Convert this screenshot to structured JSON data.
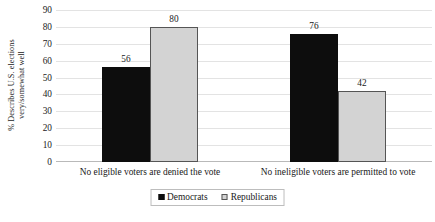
{
  "chart_data": {
    "type": "bar",
    "title": "",
    "subtitle": "",
    "xlabel": "",
    "ylabel_lines": [
      "% Describes U.S. elections",
      "very/somewhat well"
    ],
    "ylabel": "% Describes U.S. elections very/somewhat well",
    "ylim": [
      0,
      90
    ],
    "ytick_step": 10,
    "yticks": [
      90,
      80,
      70,
      60,
      50,
      40,
      30,
      20,
      10,
      0
    ],
    "grid": true,
    "grid_axis": "y",
    "legend_position": "bottom-center",
    "categories": [
      "No eligible voters are denied the vote",
      "No ineligible voters are permitted to vote"
    ],
    "series": [
      {
        "name": "Democrats",
        "color": "#0d0d0d",
        "values": [
          56,
          76
        ],
        "value_labels": [
          "56",
          "76"
        ]
      },
      {
        "name": "Republicans",
        "color": "#d3d3d3",
        "values": [
          80,
          42
        ],
        "value_labels": [
          "80",
          "42"
        ]
      }
    ],
    "annotations": []
  },
  "legend": {
    "items": [
      {
        "label": "Democrats",
        "swatch": "black-square-icon"
      },
      {
        "label": "Republicans",
        "swatch": "gray-square-icon"
      }
    ]
  }
}
